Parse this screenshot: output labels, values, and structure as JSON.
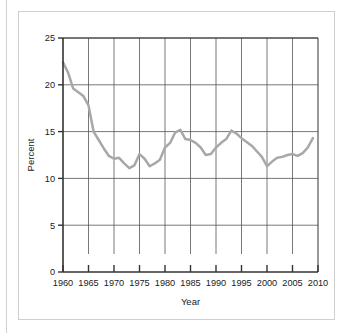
{
  "chart_data": {
    "type": "line",
    "title": "",
    "xlabel": "Year",
    "ylabel": "Percent",
    "xlim": [
      1960,
      2010
    ],
    "ylim": [
      0,
      25
    ],
    "xticks": [
      1960,
      1965,
      1970,
      1975,
      1980,
      1985,
      1990,
      1995,
      2000,
      2005,
      2010
    ],
    "yticks": [
      0,
      5,
      10,
      15,
      20,
      25
    ],
    "xtick_labels": [
      "1960",
      "1965",
      "1970",
      "1975",
      "1980",
      "1985",
      "1990",
      "1995",
      "2000",
      "2005",
      "2010"
    ],
    "ytick_labels": [
      "0",
      "5",
      "10",
      "15",
      "20",
      "25"
    ],
    "grid": true,
    "grid_axes": "both",
    "legend": false,
    "series": [
      {
        "name": "Percent",
        "color": "#a8a8a8",
        "line_width": 2.5,
        "x": [
          1960,
          1961,
          1962,
          1963,
          1964,
          1965,
          1966,
          1967,
          1968,
          1969,
          1970,
          1971,
          1972,
          1973,
          1974,
          1975,
          1976,
          1977,
          1978,
          1979,
          1980,
          1981,
          1982,
          1983,
          1984,
          1985,
          1986,
          1987,
          1988,
          1989,
          1990,
          1991,
          1992,
          1993,
          1994,
          1995,
          1996,
          1997,
          1998,
          1999,
          2000,
          2001,
          2002,
          2003,
          2004,
          2005,
          2006,
          2007,
          2008,
          2009
        ],
        "values": [
          22.4,
          21.3,
          19.6,
          19.2,
          18.8,
          17.8,
          15.0,
          14.1,
          13.2,
          12.4,
          12.1,
          12.2,
          11.6,
          11.1,
          11.4,
          12.6,
          12.1,
          11.3,
          11.6,
          12.0,
          13.3,
          13.8,
          14.9,
          15.2,
          14.2,
          14.1,
          13.8,
          13.3,
          12.5,
          12.6,
          13.3,
          13.8,
          14.2,
          15.1,
          14.8,
          14.3,
          13.9,
          13.5,
          12.9,
          12.3,
          11.3,
          11.8,
          12.2,
          12.3,
          12.5,
          12.6,
          12.4,
          12.7,
          13.3,
          14.3
        ]
      }
    ]
  },
  "figure": {
    "plot_left": 63,
    "plot_right": 318,
    "plot_top": 38,
    "plot_bottom": 272,
    "axis_color": "#333333",
    "grid_color": "#555555",
    "background": "#ffffff"
  }
}
